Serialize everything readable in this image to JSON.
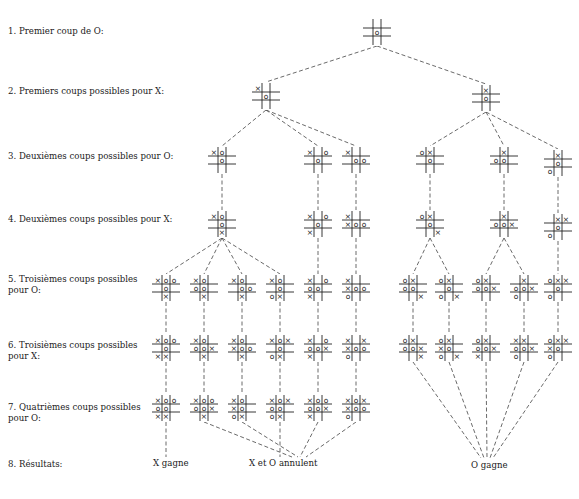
{
  "rows": [
    {
      "label": "1. Premier coup de O:",
      "y": 32
    },
    {
      "label": "2. Premiers coups possibles pour X:",
      "y": 92
    },
    {
      "label": "3. Deuxièmes coups possibles pour O:",
      "y": 157
    },
    {
      "label": "4. Deuxièmes coups possibles pour X:",
      "y": 220
    },
    {
      "label": "5. Troisièmes coups possibles\n    pour O:",
      "y": 280
    },
    {
      "label": "6. Troisièmes coups possibles\n    pour X:",
      "y": 346
    },
    {
      "label": "7. Quatrièmes coups possibles\n    pour O:",
      "y": 408
    },
    {
      "label": "8. Résultats:",
      "y": 465
    }
  ],
  "results": [
    {
      "label": "X gagne",
      "x": 153,
      "y": 464
    },
    {
      "label": "X et O annulent",
      "x": 249,
      "y": 464
    },
    {
      "label": "O gagne",
      "x": 471,
      "y": 466
    }
  ],
  "nodes": [
    {
      "id": "r",
      "x": 377,
      "y": 32,
      "b": "    O    "
    },
    {
      "id": "a",
      "x": 266,
      "y": 96,
      "b": "X   O    "
    },
    {
      "id": "b",
      "x": 486,
      "y": 98,
      "b": " X  O    "
    },
    {
      "id": "a1",
      "x": 222,
      "y": 160,
      "b": "XO  O    "
    },
    {
      "id": "a2",
      "x": 318,
      "y": 160,
      "b": "X O O    "
    },
    {
      "id": "a3",
      "x": 356,
      "y": 160,
      "b": "X   OO   "
    },
    {
      "id": "b1",
      "x": 430,
      "y": 160,
      "b": "OX  O    "
    },
    {
      "id": "b2",
      "x": 504,
      "y": 160,
      "b": " X OO    "
    },
    {
      "id": "b3",
      "x": 558,
      "y": 163,
      "b": " X  O O  "
    },
    {
      "id": "a1x",
      "x": 222,
      "y": 224,
      "b": "XO  O  X "
    },
    {
      "id": "a2x",
      "x": 318,
      "y": 224,
      "b": "X O O X  "
    },
    {
      "id": "a3x",
      "x": 356,
      "y": 224,
      "b": "X  XOO   "
    },
    {
      "id": "b1x",
      "x": 430,
      "y": 224,
      "b": "OX  O   X"
    },
    {
      "id": "b2x",
      "x": 504,
      "y": 224,
      "b": " X OOX   "
    },
    {
      "id": "b3x",
      "x": 558,
      "y": 227,
      "b": " XX O O  "
    },
    {
      "id": "c1",
      "x": 166,
      "y": 288,
      "b": "XOO O  X "
    },
    {
      "id": "c2",
      "x": 204,
      "y": 288,
      "b": "XO OO  X "
    },
    {
      "id": "c3",
      "x": 242,
      "y": 288,
      "b": "XO  OO X "
    },
    {
      "id": "c4",
      "x": 280,
      "y": 288,
      "b": "XO  O OX "
    },
    {
      "id": "c5",
      "x": 318,
      "y": 288,
      "b": "X OOO X  "
    },
    {
      "id": "c6",
      "x": 356,
      "y": 288,
      "b": "X  XOOO  "
    },
    {
      "id": "d1",
      "x": 413,
      "y": 288,
      "b": "OX OO   X"
    },
    {
      "id": "d2",
      "x": 449,
      "y": 288,
      "b": "OX  O O X"
    },
    {
      "id": "d3",
      "x": 486,
      "y": 288,
      "b": "OX OOX   "
    },
    {
      "id": "d4",
      "x": 524,
      "y": 288,
      "b": " X OOXO  "
    },
    {
      "id": "d5",
      "x": 558,
      "y": 288,
      "b": "OXX O O  "
    },
    {
      "id": "c1x",
      "x": 166,
      "y": 348,
      "b": "XOO O XX "
    },
    {
      "id": "c2x",
      "x": 204,
      "y": 348,
      "b": "XO OOX X "
    },
    {
      "id": "c3x",
      "x": 242,
      "y": 348,
      "b": "XO XOO X "
    },
    {
      "id": "c4x",
      "x": 280,
      "y": 348,
      "b": "XOX O OX "
    },
    {
      "id": "c5x",
      "x": 318,
      "y": 348,
      "b": "X OOOXX  "
    },
    {
      "id": "c6x",
      "x": 356,
      "y": 348,
      "b": "X XXOOO  "
    },
    {
      "id": "d1x",
      "x": 413,
      "y": 348,
      "b": "OX OOX  X"
    },
    {
      "id": "d2x",
      "x": 449,
      "y": 348,
      "b": "OX XO O X"
    },
    {
      "id": "d3x",
      "x": 486,
      "y": 348,
      "b": "OX OOXX  "
    },
    {
      "id": "d4x",
      "x": 524,
      "y": 348,
      "b": "XX OOXO  "
    },
    {
      "id": "d5x",
      "x": 558,
      "y": 348,
      "b": "OXXXO O  "
    },
    {
      "id": "e1",
      "x": 166,
      "y": 408,
      "b": "XOOOO XX "
    },
    {
      "id": "e2",
      "x": 204,
      "y": 408,
      "b": "XOOOOX X "
    },
    {
      "id": "e3",
      "x": 242,
      "y": 408,
      "b": "XO XO OX "
    },
    {
      "id": "e4",
      "x": 280,
      "y": 408,
      "b": "XOXOO OX "
    },
    {
      "id": "e5",
      "x": 318,
      "y": 408,
      "b": "XOOOOXX  "
    },
    {
      "id": "e6",
      "x": 356,
      "y": 408,
      "b": "XOXXOOO  "
    }
  ],
  "edges": [
    [
      "r",
      "a"
    ],
    [
      "r",
      "b"
    ],
    [
      "a",
      "a1"
    ],
    [
      "a",
      "a2"
    ],
    [
      "a",
      "a3"
    ],
    [
      "b",
      "b1"
    ],
    [
      "b",
      "b2"
    ],
    [
      "b",
      "b3"
    ],
    [
      "a1",
      "a1x"
    ],
    [
      "a2",
      "a2x"
    ],
    [
      "a3",
      "a3x"
    ],
    [
      "b1",
      "b1x"
    ],
    [
      "b2",
      "b2x"
    ],
    [
      "b3",
      "b3x"
    ],
    [
      "a1x",
      "c1"
    ],
    [
      "a1x",
      "c2"
    ],
    [
      "a1x",
      "c3"
    ],
    [
      "a1x",
      "c4"
    ],
    [
      "a2x",
      "c5"
    ],
    [
      "a3x",
      "c6"
    ],
    [
      "b1x",
      "d1"
    ],
    [
      "b1x",
      "d2"
    ],
    [
      "b2x",
      "d3"
    ],
    [
      "b2x",
      "d4"
    ],
    [
      "b3x",
      "d5"
    ],
    [
      "c1",
      "c1x"
    ],
    [
      "c2",
      "c2x"
    ],
    [
      "c3",
      "c3x"
    ],
    [
      "c4",
      "c4x"
    ],
    [
      "c5",
      "c5x"
    ],
    [
      "c6",
      "c6x"
    ],
    [
      "d1",
      "d1x"
    ],
    [
      "d2",
      "d2x"
    ],
    [
      "d3",
      "d3x"
    ],
    [
      "d4",
      "d4x"
    ],
    [
      "d5",
      "d5x"
    ],
    [
      "c1x",
      "e1"
    ],
    [
      "c2x",
      "e2"
    ],
    [
      "c3x",
      "e3"
    ],
    [
      "c4x",
      "e4"
    ],
    [
      "c5x",
      "e5"
    ],
    [
      "c6x",
      "e6"
    ]
  ],
  "result_edges": [
    {
      "from": "e1",
      "to": [
        166,
        457
      ]
    },
    {
      "from": "e2",
      "to": [
        292,
        457
      ]
    },
    {
      "from": "e3",
      "to": [
        298,
        457
      ]
    },
    {
      "from": "e4",
      "to": [
        280,
        457
      ]
    },
    {
      "from": "e5",
      "to": [
        300,
        457
      ]
    },
    {
      "from": "e6",
      "to": [
        306,
        457
      ]
    },
    {
      "from": "d1x",
      "to": [
        481,
        458
      ]
    },
    {
      "from": "d2x",
      "to": [
        484,
        458
      ]
    },
    {
      "from": "d3x",
      "to": [
        487,
        458
      ]
    },
    {
      "from": "d4x",
      "to": [
        490,
        458
      ]
    },
    {
      "from": "d5x",
      "to": [
        493,
        458
      ]
    }
  ]
}
